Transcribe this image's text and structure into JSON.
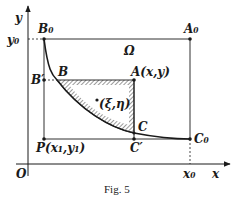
{
  "figure": {
    "caption": "Fig. 5",
    "region_label": "Ω",
    "axes": {
      "x_label": "x",
      "y_label": "y",
      "origin_label": "O",
      "x0_tick": "x₀",
      "y0_tick": "y₀"
    },
    "points": {
      "B0": "B₀",
      "A0": "A₀",
      "C0": "C₀",
      "B": "B",
      "B_prime": "B′",
      "A": "A(x,y)",
      "C": "C",
      "C_prime": "C′",
      "P": "P(x₁,y₁)",
      "xi_eta": "(ξ,η)"
    },
    "colors": {
      "ink": "#1a1a1a",
      "background": "#ffffff",
      "hatch": "#555555"
    }
  }
}
